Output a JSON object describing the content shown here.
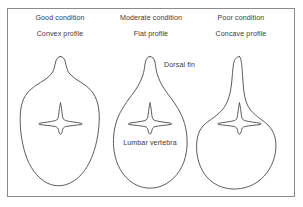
{
  "figure": {
    "title_absent": true,
    "border_color": "#8a8a8a",
    "line_color": "#4a4a4a",
    "text_color": "#3a3a3a",
    "background": "#ffffff",
    "panels": [
      {
        "id": "good",
        "condition_label": "Good condition",
        "profile_label": "Convex profile",
        "profile_type": "convex",
        "label_x": 60,
        "condition_y": 18,
        "profile_y": 34
      },
      {
        "id": "moderate",
        "condition_label": "Moderate condition",
        "profile_label": "Flat profile",
        "profile_type": "flat",
        "label_x": 150,
        "condition_y": 18,
        "profile_y": 34
      },
      {
        "id": "poor",
        "condition_label": "Poor condition",
        "profile_label": "Concave profile",
        "profile_type": "concave",
        "label_x": 240,
        "condition_y": 18,
        "profile_y": 34
      }
    ],
    "annotations": [
      {
        "id": "dorsal-fin",
        "text": "Dorsal fin",
        "x": 164,
        "y": 65,
        "align": "left"
      },
      {
        "id": "lumbar-vertebra",
        "text": "Lumbar vertebra",
        "x": 148,
        "y": 143,
        "align": "center"
      }
    ]
  }
}
